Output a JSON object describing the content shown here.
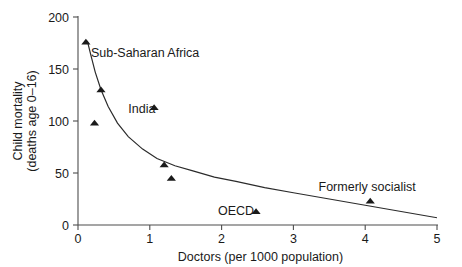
{
  "chart_data": {
    "type": "scatter",
    "title": "",
    "subtitle": "",
    "xlabel": "Doctors (per 1000 population)",
    "ylabel_line1": "Child mortality",
    "ylabel_line2": "(deaths age 0–16)",
    "ylabel": "Child mortality (deaths age 0–16)",
    "xlim": [
      0,
      5
    ],
    "ylim": [
      0,
      200
    ],
    "xticks": [
      0,
      1,
      2,
      3,
      4,
      5
    ],
    "xtick_labels": [
      "0",
      "1",
      "2",
      "3",
      "4",
      "5"
    ],
    "yticks": [
      0,
      50,
      100,
      150,
      200
    ],
    "ytick_labels": [
      "0",
      "50",
      "100",
      "150",
      "200"
    ],
    "grid": false,
    "legend": "none",
    "marker_shape": "triangle",
    "points": [
      {
        "x": 0.11,
        "y": 176,
        "label": ""
      },
      {
        "x": 0.32,
        "y": 130,
        "label": ""
      },
      {
        "x": 0.23,
        "y": 98,
        "label": ""
      },
      {
        "x": 1.06,
        "y": 113,
        "label": ""
      },
      {
        "x": 1.2,
        "y": 58,
        "label": ""
      },
      {
        "x": 1.3,
        "y": 45,
        "label": ""
      },
      {
        "x": 2.48,
        "y": 13,
        "label": ""
      },
      {
        "x": 4.07,
        "y": 23,
        "label": ""
      }
    ],
    "annotations": [
      {
        "text": "Sub-Saharan Africa",
        "x": 0.18,
        "y": 166,
        "anchor": "start"
      },
      {
        "text": "India",
        "x": 0.7,
        "y": 112,
        "anchor": "start"
      },
      {
        "text": "OECD",
        "x": 1.95,
        "y": 14,
        "anchor": "start"
      },
      {
        "text": "Formerly socialist",
        "x": 3.35,
        "y": 37,
        "anchor": "start"
      }
    ],
    "fit_curve": {
      "name": "fitted decline curve",
      "x": [
        0.13,
        0.18,
        0.24,
        0.32,
        0.42,
        0.55,
        0.7,
        0.9,
        1.1,
        1.35,
        1.6,
        1.9,
        2.2,
        2.6,
        3.0,
        3.5,
        4.0,
        4.5,
        5.0
      ],
      "y": [
        177,
        163,
        147,
        130,
        114,
        98,
        85,
        73,
        64,
        57,
        52,
        46,
        42,
        36,
        31,
        25,
        19,
        13,
        7
      ]
    }
  },
  "colors": {
    "background": "#ffffff",
    "axis": "#4d4d4d",
    "text": "#1a1a1a",
    "marker": "#1a1a1a",
    "curve": "#2b2b2b"
  }
}
